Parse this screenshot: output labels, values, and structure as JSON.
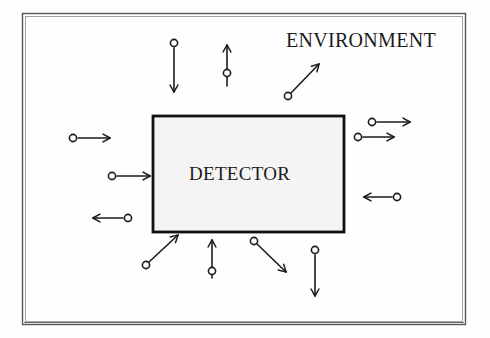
{
  "diagram": {
    "environment_label": "ENVIRONMENT",
    "detector_label": "DETECTOR",
    "colors": {
      "ink": "#1c1c1c",
      "paper": "#fefefe",
      "detector_fill": "#f4f4f4",
      "detector_border": "#111111",
      "outer_border": "#4a4a4a"
    },
    "outer_frame": {
      "x": 22,
      "y": 13,
      "width": 444,
      "height": 312,
      "style": "double-thin-rule"
    },
    "detector_box": {
      "x": 153,
      "y": 116,
      "width": 191,
      "height": 116,
      "fill": "#f4f4f4",
      "border_width": 3
    },
    "arrows": [
      {
        "id": "top-left-down",
        "direction": "down",
        "circle_at": "tail",
        "tail": [
          174,
          44
        ],
        "tip": [
          174,
          92
        ]
      },
      {
        "id": "top-mid-up",
        "direction": "up",
        "circle_at": "middle",
        "tail": [
          227,
          86
        ],
        "tip": [
          227,
          45
        ]
      },
      {
        "id": "top-right-diag-up-right",
        "direction": "up-right",
        "circle_at": "tail",
        "tail": [
          287,
          96
        ],
        "tip": [
          319,
          63
        ]
      },
      {
        "id": "left-upper-right",
        "direction": "right",
        "circle_at": "tail",
        "tail": [
          73,
          138
        ],
        "tip": [
          108,
          138
        ]
      },
      {
        "id": "left-mid-right",
        "direction": "right",
        "circle_at": "tail",
        "tail": [
          112,
          176
        ],
        "tip": [
          148,
          176
        ]
      },
      {
        "id": "left-lower-left",
        "direction": "left",
        "circle_at": "tail",
        "tail": [
          127,
          218
        ],
        "tip": [
          93,
          218
        ]
      },
      {
        "id": "right-upper-right",
        "direction": "right",
        "circle_at": "tail",
        "tail": [
          372,
          122
        ],
        "tip": [
          408,
          122
        ]
      },
      {
        "id": "right-second-right",
        "direction": "right",
        "circle_at": "tail",
        "tail": [
          358,
          137
        ],
        "tip": [
          392,
          137
        ]
      },
      {
        "id": "right-mid-left",
        "direction": "left",
        "circle_at": "tail",
        "tail": [
          396,
          197
        ],
        "tip": [
          364,
          197
        ]
      },
      {
        "id": "bottom-left-diag-up-right",
        "direction": "up-right",
        "circle_at": "tail",
        "tail": [
          146,
          264
        ],
        "tip": [
          177,
          235
        ]
      },
      {
        "id": "bottom-mid-up",
        "direction": "up",
        "circle_at": "middle",
        "tail": [
          212,
          278
        ],
        "tip": [
          212,
          240
        ]
      },
      {
        "id": "bottom-right-diag-down-right",
        "direction": "down-right",
        "circle_at": "tail",
        "tail": [
          254,
          241
        ],
        "tip": [
          285,
          271
        ]
      },
      {
        "id": "bottom-far-right-down",
        "direction": "down",
        "circle_at": "tail",
        "tail": [
          315,
          250
        ],
        "tip": [
          315,
          296
        ]
      }
    ],
    "notes": {
      "circle_radius": 3.6,
      "stroke_width": 1.6,
      "arrowhead_style": "open-v"
    }
  }
}
